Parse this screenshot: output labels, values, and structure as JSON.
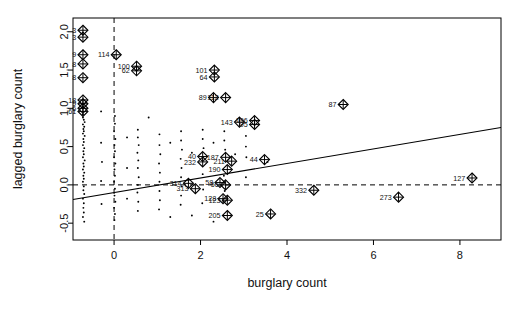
{
  "chart_data": {
    "type": "scatter",
    "title": "",
    "xlabel": "burglary count",
    "ylabel": "lagged burglary count",
    "xlim": [
      -0.95,
      8.95
    ],
    "ylim": [
      -0.72,
      2.18
    ],
    "xticks": [
      0,
      2,
      4,
      6,
      8
    ],
    "xticklabels": [
      "0",
      "2",
      "4",
      "6",
      "8"
    ],
    "yticks": [
      -0.5,
      0.0,
      0.5,
      1.0,
      1.5,
      2.0
    ],
    "yticklabels": [
      "-0.5",
      "0.0",
      "0.5",
      "1.0",
      "1.5",
      "2.0"
    ],
    "grid": false,
    "legend": null,
    "marker": "diamond-cross",
    "reference_lines": [
      {
        "orientation": "horizontal",
        "value": 0.0,
        "style": "dashed"
      },
      {
        "orientation": "vertical",
        "value": 0.0,
        "style": "dashed"
      }
    ],
    "fit_line": {
      "style": "solid",
      "x0": -0.95,
      "y0": -0.19,
      "x1": 8.95,
      "y1": 0.75
    },
    "labeled_points": [
      {
        "label": "3",
        "x": -0.72,
        "y": 2.02
      },
      {
        "label": "3",
        "x": -0.72,
        "y": 1.93
      },
      {
        "label": "9",
        "x": -0.72,
        "y": 1.7
      },
      {
        "label": "114",
        "x": 0.05,
        "y": 1.7
      },
      {
        "label": "8",
        "x": -0.72,
        "y": 1.58
      },
      {
        "label": "100",
        "x": 0.52,
        "y": 1.55
      },
      {
        "label": "62",
        "x": 0.52,
        "y": 1.49
      },
      {
        "label": "101",
        "x": 2.32,
        "y": 1.5
      },
      {
        "label": "64",
        "x": 2.32,
        "y": 1.41
      },
      {
        "label": "8",
        "x": -0.72,
        "y": 1.4
      },
      {
        "label": "89",
        "x": 2.3,
        "y": 1.14
      },
      {
        "label": "112",
        "x": 2.58,
        "y": 1.14
      },
      {
        "label": "87",
        "x": 5.3,
        "y": 1.05
      },
      {
        "label": "18",
        "x": -0.72,
        "y": 1.11
      },
      {
        "label": "9",
        "x": -0.72,
        "y": 1.06
      },
      {
        "label": "6",
        "x": -0.72,
        "y": 1.0
      },
      {
        "label": "61",
        "x": -0.72,
        "y": 0.96
      },
      {
        "label": "143",
        "x": 2.9,
        "y": 0.82
      },
      {
        "label": "196",
        "x": 3.25,
        "y": 0.84
      },
      {
        "label": "95",
        "x": 3.25,
        "y": 0.79
      },
      {
        "label": "40",
        "x": 2.05,
        "y": 0.37
      },
      {
        "label": "232",
        "x": 2.05,
        "y": 0.3
      },
      {
        "label": "187",
        "x": 2.58,
        "y": 0.36
      },
      {
        "label": "211",
        "x": 2.72,
        "y": 0.31
      },
      {
        "label": "44",
        "x": 3.48,
        "y": 0.33
      },
      {
        "label": "190",
        "x": 2.62,
        "y": 0.2
      },
      {
        "label": "314",
        "x": 1.72,
        "y": 0.02
      },
      {
        "label": "313",
        "x": 1.88,
        "y": -0.05
      },
      {
        "label": "58",
        "x": 2.45,
        "y": 0.03
      },
      {
        "label": "56",
        "x": 2.58,
        "y": 0.0
      },
      {
        "label": "332",
        "x": 4.62,
        "y": -0.07
      },
      {
        "label": "127",
        "x": 8.28,
        "y": 0.09
      },
      {
        "label": "273",
        "x": 6.58,
        "y": -0.16
      },
      {
        "label": "128",
        "x": 2.52,
        "y": -0.18
      },
      {
        "label": "123",
        "x": 2.62,
        "y": -0.2
      },
      {
        "label": "205",
        "x": 2.62,
        "y": -0.4
      },
      {
        "label": "25",
        "x": 3.62,
        "y": -0.38
      }
    ]
  }
}
